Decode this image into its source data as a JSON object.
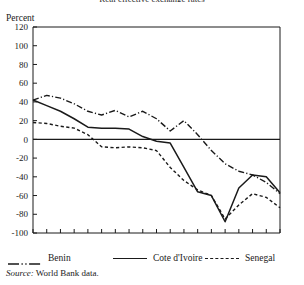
{
  "figure": {
    "clipped_title": "Real effective exchange rates",
    "yaxis_title": "Percent",
    "source_lead": "Source:",
    "source_text": "World Bank data."
  },
  "legend": [
    {
      "label": "Benin",
      "style": "dash-dot"
    },
    {
      "label": "Cote d'Ivoire",
      "style": "solid"
    },
    {
      "label": "Senegal",
      "style": "dashed"
    }
  ],
  "chart_data": {
    "type": "line",
    "title": "Real effective exchange rates",
    "xlabel": "",
    "ylabel": "Percent",
    "xlim": [
      1970,
      1988
    ],
    "ylim": [
      -100,
      120
    ],
    "ytick_step": 20,
    "yticks": [
      120,
      100,
      80,
      60,
      40,
      20,
      0,
      -20,
      -40,
      -60,
      -80,
      -100
    ],
    "xticks": [
      1970,
      1971,
      1972,
      1973,
      1974,
      1975,
      1976,
      1977,
      1978,
      1979,
      1980,
      1981,
      1982,
      1983,
      1984,
      1985,
      1986,
      1987,
      1988
    ],
    "xtick_labels": [
      1970,
      1972,
      1974,
      1976,
      1978,
      1980,
      1982,
      1984,
      1986,
      1988
    ],
    "grid": false,
    "zero_line": true,
    "legend_position": "below",
    "x": [
      1970,
      1971,
      1972,
      1973,
      1974,
      1975,
      1976,
      1977,
      1978,
      1979,
      1980,
      1981,
      1982,
      1983,
      1984,
      1985,
      1986,
      1987,
      1988
    ],
    "series": [
      {
        "name": "Benin",
        "style": "dash-dot",
        "values": [
          42,
          47,
          44,
          38,
          30,
          26,
          31,
          24,
          30,
          22,
          9,
          20,
          5,
          -12,
          -26,
          -34,
          -38,
          -46,
          -58
        ]
      },
      {
        "name": "Cote d'Ivoire",
        "style": "solid",
        "values": [
          42,
          36,
          30,
          22,
          13,
          12,
          12,
          11,
          3,
          -2,
          -4,
          -30,
          -56,
          -60,
          -88,
          -52,
          -38,
          -40,
          -57
        ]
      },
      {
        "name": "Senegal",
        "style": "dashed",
        "values": [
          18,
          17,
          14,
          12,
          5,
          -8,
          -9,
          -8,
          -9,
          -12,
          -30,
          -44,
          -54,
          -60,
          -85,
          -70,
          -58,
          -62,
          -73
        ]
      }
    ]
  }
}
